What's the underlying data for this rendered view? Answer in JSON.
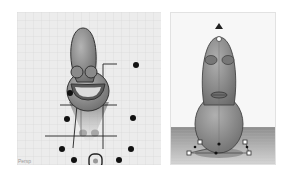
{
  "scene": {
    "left_view": {
      "name": "perspective-view",
      "corner_label": "Persp",
      "grid": {
        "color": "#cfcfcf",
        "background": "#ececec"
      },
      "model": {
        "name": "character-figure",
        "body_color": "#8c8c8c",
        "outline_color": "#333333",
        "features": [
          "left-eye",
          "right-eye",
          "open-smile-mouth"
        ]
      },
      "handles": {
        "color": "#111111",
        "count": 9,
        "center_handle": "rotate-handle"
      }
    },
    "right_view": {
      "name": "front-view",
      "background": "#f7f7f7",
      "floor_color": "#9a9a9a",
      "model": {
        "name": "character-figure",
        "body_color": "#8a8a8a",
        "outline_color": "#444444",
        "features": [
          "left-eye",
          "right-eye",
          "lips"
        ]
      },
      "handles": {
        "color": "#222222",
        "top_arrow": "height-arrow"
      }
    }
  }
}
